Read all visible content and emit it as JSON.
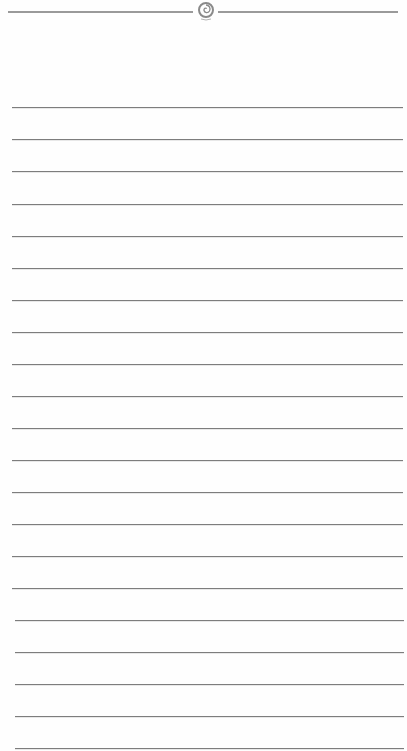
{
  "page": {
    "type": "lined-notepaper",
    "background_color": "#fefefe",
    "line_color": "#7d7d7d",
    "header_rule_color": "#9a9a9a",
    "ornament_icon": "swirl-ornament-icon"
  },
  "header": {
    "rule_y": 11,
    "ornament_center_x": 205
  },
  "lines": {
    "count": 21,
    "positions_y": [
      107,
      139,
      171,
      204,
      236,
      268,
      300,
      332,
      364,
      396,
      428,
      460,
      492,
      524,
      556,
      588,
      620,
      652,
      684,
      716,
      748
    ],
    "left_x": 12,
    "right_x": 403
  }
}
